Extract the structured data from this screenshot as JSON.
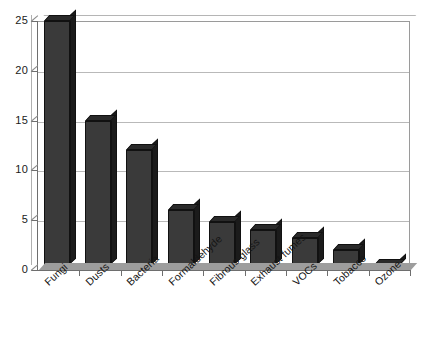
{
  "chart_data": {
    "type": "bar",
    "title": "",
    "subtitle": "",
    "xlabel": "",
    "ylabel": "",
    "categories": [
      "Fungi",
      "Dusts",
      "Bacteria",
      "Formaldehyde",
      "Fibrous glass",
      "Exhaust fumes",
      "VOCs",
      "Tobacco",
      "Ozone"
    ],
    "values": [
      25,
      15,
      12,
      6,
      4.8,
      4,
      3.2,
      2,
      0.5
    ],
    "series": [
      {
        "name": "",
        "values": [
          25,
          15,
          12,
          6,
          4.8,
          4,
          3.2,
          2,
          0.5
        ]
      }
    ],
    "ylim": [
      0,
      25
    ],
    "yticks": [
      0,
      5,
      10,
      15,
      20,
      25
    ],
    "ytick_labels": [
      "0",
      "5",
      "10",
      "15",
      "20",
      "25"
    ],
    "grid": "horizontal",
    "legend": "none",
    "style": "3d-bar",
    "bar_color": "#3a3a3a",
    "bar_top_color": "#2a2a2a",
    "bar_side_color": "#1b1b1b",
    "gridline_color": "#b9b9b9",
    "axis_color": "#6e6e6e",
    "plot_background": "#ffffff",
    "label_rotation_degrees": -43
  }
}
